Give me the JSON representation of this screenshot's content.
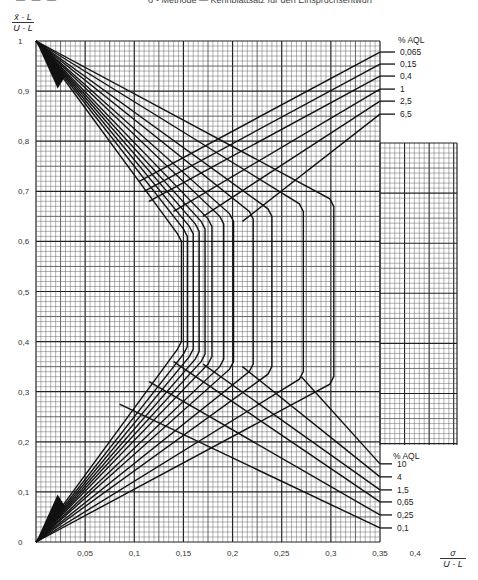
{
  "header": {
    "page_marks": "— — —",
    "title": "σ - Methode — Kennblattsatz für den Einspruchsentwurf"
  },
  "axes": {
    "y_label_num": "x̄ - L",
    "y_label_den": "U - L",
    "x_label_num": "σ",
    "x_label_den": "U - L"
  },
  "chart_data": {
    "type": "line",
    "title": "",
    "xlabel": "σ / (U - L)",
    "ylabel": "(x̄ - L) / (U - L)",
    "xlim": [
      0,
      0.4
    ],
    "ylim": [
      0,
      1
    ],
    "grid": true,
    "x_ticks": [
      "0.05",
      "0.1",
      "0.15",
      "0.2",
      "0.25",
      "0.3",
      "0.35",
      "0.4"
    ],
    "y_ticks": [
      "0",
      "0.1",
      "0.2",
      "0.3",
      "0.4",
      "0.5",
      "0.6",
      "0.7",
      "0.8",
      "0.9",
      "1"
    ],
    "x_tick_labels": [
      "0,05",
      "0,1",
      "0,15",
      "0,2",
      "0,25",
      "0,3",
      "0,35",
      "0,4"
    ],
    "y_tick_labels": [
      "0",
      "0,1",
      "0,2",
      "0,3",
      "0,4",
      "0,5",
      "0,6",
      "0,7",
      "0,8",
      "0,9",
      "1"
    ],
    "legend_upper": {
      "title": "% AQL",
      "entries": [
        "0,065",
        "0,15",
        "0,4",
        "1",
        "2,5",
        "6,5"
      ],
      "end_y": [
        0.978,
        0.954,
        0.93,
        0.904,
        0.88,
        0.854
      ]
    },
    "legend_lower": {
      "title": "% AQL",
      "entries": [
        "10",
        "4",
        "1,5",
        "0,65",
        "0,25",
        "0,1"
      ],
      "end_y": [
        0.156,
        0.13,
        0.104,
        0.08,
        0.054,
        0.028
      ]
    },
    "acceptance_boundaries": [
      {
        "knee_x": 0.148,
        "upper_knee_y": 0.6,
        "lower_knee_y": 0.4
      },
      {
        "knee_x": 0.154,
        "upper_knee_y": 0.61,
        "lower_knee_y": 0.39
      },
      {
        "knee_x": 0.16,
        "upper_knee_y": 0.615,
        "lower_knee_y": 0.385
      },
      {
        "knee_x": 0.166,
        "upper_knee_y": 0.62,
        "lower_knee_y": 0.38
      },
      {
        "knee_x": 0.172,
        "upper_knee_y": 0.625,
        "lower_knee_y": 0.375
      },
      {
        "knee_x": 0.179,
        "upper_knee_y": 0.63,
        "lower_knee_y": 0.37
      },
      {
        "knee_x": 0.191,
        "upper_knee_y": 0.635,
        "lower_knee_y": 0.365
      },
      {
        "knee_x": 0.201,
        "upper_knee_y": 0.64,
        "lower_knee_y": 0.36
      },
      {
        "knee_x": 0.221,
        "upper_knee_y": 0.645,
        "lower_knee_y": 0.355
      },
      {
        "knee_x": 0.24,
        "upper_knee_y": 0.65,
        "lower_knee_y": 0.35
      },
      {
        "knee_x": 0.272,
        "upper_knee_y": 0.66,
        "lower_knee_y": 0.34
      },
      {
        "knee_x": 0.303,
        "upper_knee_y": 0.67,
        "lower_knee_y": 0.33
      }
    ],
    "upper_branch_lines": [
      {
        "aql": "0,065",
        "from": [
          0.105,
          0.72
        ],
        "to": [
          0.35,
          0.978
        ]
      },
      {
        "aql": "0,15",
        "from": [
          0.11,
          0.7
        ],
        "to": [
          0.35,
          0.954
        ]
      },
      {
        "aql": "0,4",
        "from": [
          0.115,
          0.68
        ],
        "to": [
          0.35,
          0.93
        ]
      },
      {
        "aql": "1",
        "from": [
          0.14,
          0.66
        ],
        "to": [
          0.35,
          0.904
        ]
      },
      {
        "aql": "2,5",
        "from": [
          0.17,
          0.65
        ],
        "to": [
          0.35,
          0.88
        ]
      },
      {
        "aql": "6,5",
        "from": [
          0.21,
          0.64
        ],
        "to": [
          0.35,
          0.854
        ]
      }
    ],
    "lower_branch_lines": [
      {
        "aql": "10",
        "from": [
          0.27,
          0.33
        ],
        "to": [
          0.35,
          0.156
        ]
      },
      {
        "aql": "4",
        "from": [
          0.21,
          0.35
        ],
        "to": [
          0.35,
          0.13
        ]
      },
      {
        "aql": "1,5",
        "from": [
          0.17,
          0.355
        ],
        "to": [
          0.35,
          0.104
        ]
      },
      {
        "aql": "0,65",
        "from": [
          0.14,
          0.36
        ],
        "to": [
          0.35,
          0.08
        ]
      },
      {
        "aql": "0,25",
        "from": [
          0.115,
          0.32
        ],
        "to": [
          0.35,
          0.054
        ]
      },
      {
        "aql": "0,1",
        "from": [
          0.085,
          0.275
        ],
        "to": [
          0.35,
          0.028
        ]
      }
    ]
  }
}
